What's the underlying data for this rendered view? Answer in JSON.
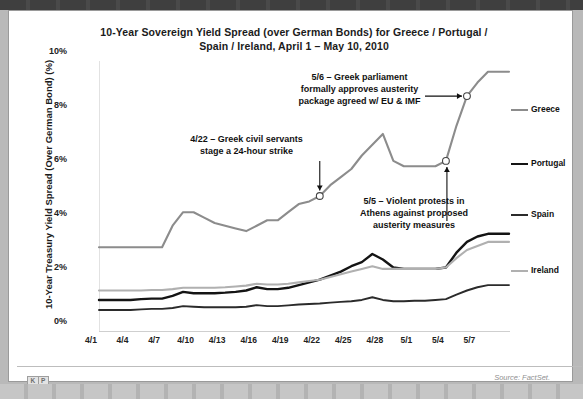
{
  "slide": {
    "title": "10-Year Sovereign Yield Spread (over German Bonds) for Greece / Portugal / Spain / Ireland, April 1 – May 10, 2010",
    "title_line1": "10-Year Sovereign Yield Spread (over German Bonds) for Greece / Portugal /",
    "title_line2": "Spain / Ireland, April 1 – May 10, 2010"
  },
  "footer": {
    "logo_letters": [
      "K",
      "P",
      "C",
      "B"
    ],
    "url": "www.kpcb.com",
    "source": "Source: FactSet.",
    "deck_label": "USA Inc. | Consequences of Inaction",
    "page_number": "429"
  },
  "annotations": [
    {
      "id": "anno-5-6",
      "line1": "5/6 – Greek parliament",
      "line2": "formally approves austerity",
      "line3": "package agreed w/ EU & IMF",
      "marker_x": "5/6",
      "marker_value": 8.7
    },
    {
      "id": "anno-4-22",
      "line1": "4/22 – Greek civil servants",
      "line2": "stage a 24-hour strike",
      "line3": "",
      "marker_x": "4/22",
      "marker_value": 5.0
    },
    {
      "id": "anno-5-5",
      "line1": "5/5 – Violent protests in",
      "line2": "Athens against proposed",
      "line3": "austerity measures",
      "marker_x": "5/4",
      "marker_value": 6.3
    }
  ],
  "chart_data": {
    "type": "line",
    "title": "10-Year Sovereign Yield Spread (over German Bonds) for Greece / Portugal / Spain / Ireland, April 1 – May 10, 2010",
    "xlabel": "",
    "ylabel": "10-Year Treasury Yield Spread (Over German Bond) (%)",
    "ylim": [
      0,
      10
    ],
    "yticks": [
      0,
      2,
      4,
      6,
      8,
      10
    ],
    "ytick_labels": [
      "0%",
      "2%",
      "4%",
      "6%",
      "8%",
      "10%"
    ],
    "xtick_labels": [
      "4/1",
      "4/4",
      "4/7",
      "4/10",
      "4/13",
      "4/16",
      "4/19",
      "4/22",
      "4/25",
      "4/28",
      "5/1",
      "5/4",
      "5/7"
    ],
    "x": [
      "4/1",
      "4/2",
      "4/3",
      "4/4",
      "4/5",
      "4/6",
      "4/7",
      "4/8",
      "4/9",
      "4/10",
      "4/11",
      "4/12",
      "4/13",
      "4/14",
      "4/15",
      "4/16",
      "4/17",
      "4/18",
      "4/19",
      "4/20",
      "4/21",
      "4/22",
      "4/23",
      "4/24",
      "4/25",
      "4/26",
      "4/27",
      "4/28",
      "4/29",
      "4/30",
      "5/1",
      "5/2",
      "5/3",
      "5/4",
      "5/5",
      "5/6",
      "5/7",
      "5/8",
      "5/9",
      "5/10"
    ],
    "grid": false,
    "legend_position": "right",
    "series": [
      {
        "name": "Greece",
        "color": "#8c8c8c",
        "width": 2.1,
        "values": [
          3.1,
          3.1,
          3.1,
          3.1,
          3.1,
          3.1,
          3.1,
          3.9,
          4.4,
          4.4,
          4.2,
          4.0,
          3.9,
          3.8,
          3.7,
          3.9,
          4.1,
          4.1,
          4.4,
          4.7,
          4.8,
          5.0,
          5.4,
          5.7,
          6.0,
          6.5,
          6.9,
          7.3,
          6.3,
          6.1,
          6.1,
          6.1,
          6.1,
          6.3,
          7.6,
          8.7,
          9.2,
          9.6,
          9.6,
          9.6
        ]
      },
      {
        "name": "Portugal",
        "color": "#141414",
        "width": 2.4,
        "values": [
          1.15,
          1.15,
          1.15,
          1.15,
          1.18,
          1.2,
          1.2,
          1.3,
          1.45,
          1.4,
          1.4,
          1.4,
          1.42,
          1.45,
          1.5,
          1.62,
          1.55,
          1.55,
          1.6,
          1.7,
          1.8,
          1.9,
          2.05,
          2.2,
          2.4,
          2.55,
          2.85,
          2.65,
          2.35,
          2.3,
          2.3,
          2.3,
          2.3,
          2.35,
          2.9,
          3.3,
          3.5,
          3.6,
          3.6,
          3.6
        ]
      },
      {
        "name": "Spain",
        "color": "#2b2b2b",
        "width": 1.9,
        "values": [
          0.78,
          0.78,
          0.78,
          0.78,
          0.8,
          0.82,
          0.82,
          0.85,
          0.92,
          0.9,
          0.88,
          0.88,
          0.88,
          0.88,
          0.9,
          0.96,
          0.92,
          0.92,
          0.95,
          0.98,
          1.0,
          1.02,
          1.05,
          1.08,
          1.1,
          1.15,
          1.25,
          1.15,
          1.1,
          1.1,
          1.12,
          1.12,
          1.15,
          1.18,
          1.35,
          1.5,
          1.62,
          1.7,
          1.7,
          1.7
        ]
      },
      {
        "name": "Ireland",
        "color": "#b0b0b0",
        "width": 2.1,
        "values": [
          1.5,
          1.5,
          1.5,
          1.5,
          1.5,
          1.52,
          1.52,
          1.55,
          1.6,
          1.6,
          1.6,
          1.6,
          1.62,
          1.65,
          1.68,
          1.75,
          1.72,
          1.72,
          1.75,
          1.8,
          1.85,
          1.9,
          2.0,
          2.1,
          2.2,
          2.3,
          2.4,
          2.3,
          2.3,
          2.3,
          2.3,
          2.3,
          2.3,
          2.35,
          2.7,
          3.0,
          3.15,
          3.3,
          3.3,
          3.3
        ]
      }
    ],
    "markers": [
      {
        "label": "4/22",
        "series": "Greece",
        "index": 21,
        "value": 5.0
      },
      {
        "label": "5/4",
        "series": "Greece",
        "index": 33,
        "value": 6.3
      },
      {
        "label": "5/6",
        "series": "Greece",
        "index": 35,
        "value": 8.7
      }
    ]
  },
  "legend": [
    {
      "label": "Greece",
      "color": "#8c8c8c",
      "width": 2.1
    },
    {
      "label": "Portugal",
      "color": "#141414",
      "width": 2.6
    },
    {
      "label": "Spain",
      "color": "#2b2b2b",
      "width": 2.0
    },
    {
      "label": "Ireland",
      "color": "#b0b0b0",
      "width": 2.1
    }
  ]
}
